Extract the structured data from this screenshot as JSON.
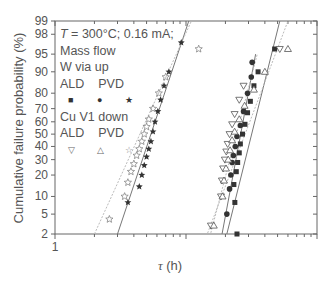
{
  "chart_data": {
    "type": "scatter",
    "title": "",
    "xlabel_symbol": "τ",
    "xlabel_unit": "(h)",
    "ylabel": "Cumulative failure probability (%)",
    "x_scale": "log",
    "y_scale": "normal-probability",
    "xlim": [
      1,
      100
    ],
    "ylim": [
      2,
      99
    ],
    "x_tick_labels": [
      "1"
    ],
    "y_ticks": [
      2,
      5,
      10,
      20,
      30,
      40,
      50,
      60,
      70,
      80,
      90,
      95,
      98,
      99
    ],
    "annotation": {
      "condition_T": "T",
      "condition_rest": " = 300°C; 0.16 mA;",
      "group1_line1": "Mass flow",
      "group1_line2": "W  via up",
      "group1_cols": "ALD    PVD",
      "group2_line1": "Cu V1 down",
      "group2_cols": "ALD    PVD"
    },
    "series": [
      {
        "name": "Mass flow W via up ALD",
        "marker": "filled-square",
        "color": "#333333",
        "points": [
          [
            24.5,
            2
          ],
          [
            23.6,
            8
          ],
          [
            23.2,
            15
          ],
          [
            24.2,
            22
          ],
          [
            24.8,
            28
          ],
          [
            25.5,
            35
          ],
          [
            26.0,
            42
          ],
          [
            27.0,
            50
          ],
          [
            28.2,
            58
          ],
          [
            29.5,
            67
          ],
          [
            31.0,
            75
          ],
          [
            33.0,
            84
          ],
          [
            35.5,
            90
          ],
          [
            47.5,
            96
          ]
        ],
        "fit_line": [
          [
            20,
            1.5
          ],
          [
            52,
            99
          ]
        ]
      },
      {
        "name": "Mass flow W via up PVD (circle)",
        "marker": "filled-circle",
        "color": "#333333",
        "points": [
          [
            20.5,
            5
          ],
          [
            21.5,
            13
          ],
          [
            22.0,
            20
          ],
          [
            22.5,
            28
          ],
          [
            23.0,
            33
          ],
          [
            23.8,
            40
          ],
          [
            24.5,
            48
          ],
          [
            26.0,
            57
          ],
          [
            27.5,
            68
          ],
          [
            29.5,
            80
          ],
          [
            31.5,
            88
          ],
          [
            32.0,
            93
          ]
        ],
        "fit_line": [
          [
            18.5,
            1.5
          ],
          [
            34,
            95
          ]
        ]
      },
      {
        "name": "Mass flow W via up PVD (star)",
        "marker": "filled-star",
        "color": "#333333",
        "points": [
          [
            3.6,
            8
          ],
          [
            4.4,
            14
          ],
          [
            4.6,
            20
          ],
          [
            4.8,
            26
          ],
          [
            5.0,
            32
          ],
          [
            5.2,
            38
          ],
          [
            5.4,
            44
          ],
          [
            5.6,
            52
          ],
          [
            5.8,
            60
          ],
          [
            6.1,
            68
          ],
          [
            6.4,
            76
          ],
          [
            6.8,
            84
          ],
          [
            7.4,
            90
          ],
          [
            9.2,
            97
          ]
        ],
        "fit_line": [
          [
            3.0,
            2
          ],
          [
            10.5,
            99
          ]
        ]
      },
      {
        "name": "Cu V1 down ALD",
        "marker": "open-triangle-down",
        "color": "#555555",
        "points": [
          [
            15.5,
            3
          ],
          [
            18.5,
            10
          ],
          [
            18.8,
            17
          ],
          [
            19.2,
            24
          ],
          [
            19.8,
            30
          ],
          [
            20.3,
            36
          ],
          [
            20.8,
            42
          ],
          [
            21.5,
            50
          ],
          [
            22.5,
            58
          ],
          [
            23.5,
            66
          ],
          [
            25.5,
            76
          ],
          [
            27.5,
            84
          ],
          [
            52,
            96
          ]
        ],
        "fit_line": [
          [
            15,
            1.5
          ],
          [
            35,
            95
          ]
        ]
      },
      {
        "name": "Cu V1 down PVD (triangle)",
        "marker": "open-triangle-up",
        "color": "#555555",
        "points": [
          [
            16.3,
            3
          ],
          [
            19.0,
            10
          ],
          [
            19.5,
            17
          ],
          [
            20.2,
            24
          ],
          [
            21.0,
            30
          ],
          [
            21.7,
            37
          ],
          [
            22.5,
            45
          ],
          [
            23.5,
            52
          ],
          [
            25.5,
            62
          ],
          [
            28.0,
            72
          ],
          [
            33,
            82
          ],
          [
            40,
            90
          ],
          [
            60,
            96
          ]
        ],
        "fit_line": [
          [
            14,
            1.5
          ],
          [
            60,
            99
          ]
        ]
      },
      {
        "name": "Cu V1 down PVD (star)",
        "marker": "open-star",
        "color": "#777777",
        "points": [
          [
            2.6,
            4
          ],
          [
            3.4,
            10
          ],
          [
            3.6,
            16
          ],
          [
            3.8,
            22
          ],
          [
            4.0,
            27
          ],
          [
            4.2,
            33
          ],
          [
            4.4,
            38
          ],
          [
            4.6,
            44
          ],
          [
            4.8,
            50
          ],
          [
            5.0,
            56
          ],
          [
            5.2,
            62
          ],
          [
            5.6,
            70
          ],
          [
            6.2,
            80
          ],
          [
            7.0,
            88
          ],
          [
            12.5,
            96
          ]
        ],
        "fit_line": [
          [
            2.0,
            2
          ],
          [
            11.0,
            99
          ]
        ]
      }
    ]
  }
}
